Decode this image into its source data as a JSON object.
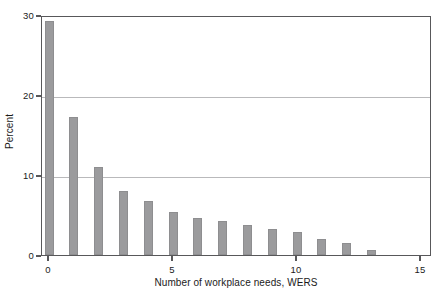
{
  "chart_data": {
    "type": "bar",
    "title": "",
    "subtitle": "",
    "xlabel": "Number of workplace needs, WERS",
    "ylabel": "Percent",
    "categories": [
      "0",
      "1",
      "2",
      "3",
      "4",
      "5",
      "6",
      "7",
      "8",
      "9",
      "10",
      "11",
      "12",
      "13"
    ],
    "x": [
      0,
      1,
      2,
      3,
      4,
      5,
      6,
      7,
      8,
      9,
      10,
      11,
      12,
      13
    ],
    "values": [
      29.3,
      17.3,
      11.0,
      8.0,
      6.7,
      5.4,
      4.6,
      4.2,
      3.7,
      3.3,
      2.9,
      2.0,
      1.5,
      0.6
    ],
    "xlim": [
      -0.28,
      15.0
    ],
    "ylim": [
      0,
      30
    ],
    "xticks": [
      0,
      5,
      10,
      15
    ],
    "xtick_labels": [
      "0",
      "5",
      "10",
      "15"
    ],
    "yticks": [
      0,
      10,
      20,
      30
    ],
    "ytick_labels": [
      "0",
      "10",
      "20",
      "30"
    ],
    "grid": "horizontal",
    "gridlines_at": [
      10,
      20
    ],
    "legend": "none",
    "bar_color": "#9b9b9d",
    "axis_color": "#58585a",
    "grid_color": "#b9b9bb",
    "background": "#ffffff"
  }
}
